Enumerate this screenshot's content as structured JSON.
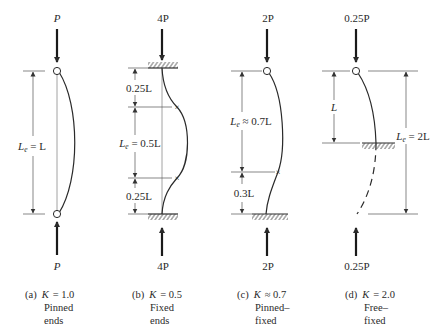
{
  "figure": {
    "panels": [
      {
        "id": "a",
        "top_load": "P",
        "bottom_load": "P",
        "dimensions": [
          {
            "label_main": "L",
            "label_sub": "e",
            "label_rest": " = L"
          }
        ],
        "caption": {
          "letter": "(a)",
          "k_symbol": "K",
          "k_relation": "= 1.0",
          "line2": "Pinned",
          "line3": "ends"
        }
      },
      {
        "id": "b",
        "top_load": "4P",
        "bottom_load": "4P",
        "dimensions": [
          {
            "label": "0.25L"
          },
          {
            "label_main": "L",
            "label_sub": "e",
            "label_rest": " = 0.5L"
          },
          {
            "label": "0.25L"
          }
        ],
        "caption": {
          "letter": "(b)",
          "k_symbol": "K",
          "k_relation": "= 0.5",
          "line2": "Fixed",
          "line3": "ends"
        }
      },
      {
        "id": "c",
        "top_load": "2P",
        "bottom_load": "2P",
        "dimensions": [
          {
            "label_main": "L",
            "label_sub": "e",
            "label_rest": " ≈ 0.7L"
          },
          {
            "label": "0.3L"
          }
        ],
        "caption": {
          "letter": "(c)",
          "k_symbol": "K",
          "k_relation": "≈ 0.7",
          "line2": "Pinned–",
          "line3": "fixed"
        }
      },
      {
        "id": "d",
        "top_load": "0.25P",
        "bottom_load": "0.25P",
        "dimensions": [
          {
            "label": "L"
          },
          {
            "label_main": "L",
            "label_sub": "e",
            "label_rest": " = 2L"
          }
        ],
        "caption": {
          "letter": "(d)",
          "k_symbol": "K",
          "k_relation": "= 2.0",
          "line2": "Free–",
          "line3": "fixed"
        }
      }
    ]
  }
}
